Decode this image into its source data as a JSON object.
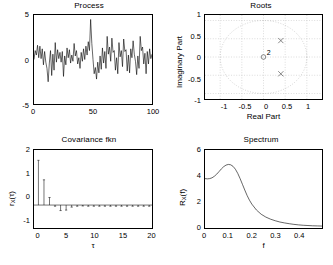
{
  "figure": {
    "background": "#ffffff",
    "line_color": "#000000",
    "grid_color": "#b8b8b8"
  },
  "panels": {
    "process": {
      "title": "Process",
      "xlabel": "",
      "ylabel": "",
      "xticks": [
        "0",
        "50",
        "100"
      ],
      "yticks": [
        "5",
        "0",
        "-5"
      ]
    },
    "roots": {
      "title": "Roots",
      "xlabel": "Real Part",
      "ylabel": "Imaginary Part",
      "xticks": [
        "-1",
        "-0.5",
        "0",
        "0.5",
        "1"
      ],
      "yticks": [
        "1",
        "0.5",
        "0",
        "-0.5",
        "-1"
      ],
      "zero_multiplicity": "2"
    },
    "covariance": {
      "title": "Covariance fkn",
      "xlabel": "τ",
      "ylabel_main": "r",
      "ylabel_sub": "X",
      "ylabel_arg": "(τ)",
      "xticks": [
        "0",
        "5",
        "10",
        "15",
        "20"
      ],
      "yticks": [
        "2",
        "1",
        "0",
        "-1"
      ]
    },
    "spectrum": {
      "title": "Spectrum",
      "xlabel": "f",
      "ylabel_main": "R",
      "ylabel_sub": "X",
      "ylabel_arg": "(f)",
      "xticks": [
        "0",
        "0.1",
        "0.2",
        "0.3",
        "0.4"
      ],
      "yticks": [
        "6",
        "4",
        "2",
        "0"
      ]
    }
  },
  "chart_data": [
    {
      "type": "line",
      "title": "Process",
      "xlabel": "",
      "ylabel": "",
      "xlim": [
        0,
        100
      ],
      "ylim": [
        -5,
        5
      ],
      "xticks": [
        0,
        50,
        100
      ],
      "yticks": [
        -5,
        0,
        5
      ],
      "grid": false,
      "x": [
        0,
        1,
        2,
        3,
        4,
        5,
        6,
        7,
        8,
        9,
        10,
        11,
        12,
        13,
        14,
        15,
        16,
        17,
        18,
        19,
        20,
        21,
        22,
        23,
        24,
        25,
        26,
        27,
        28,
        29,
        30,
        31,
        32,
        33,
        34,
        35,
        36,
        37,
        38,
        39,
        40,
        41,
        42,
        43,
        44,
        45,
        46,
        47,
        48,
        49,
        50,
        51,
        52,
        53,
        54,
        55,
        56,
        57,
        58,
        59,
        60,
        61,
        62,
        63,
        64,
        65,
        66,
        67,
        68,
        69,
        70,
        71,
        72,
        73,
        74,
        75,
        76,
        77,
        78,
        79,
        80,
        81,
        82,
        83,
        84,
        85,
        86,
        87,
        88,
        89,
        90,
        91,
        92,
        93,
        94,
        95,
        96,
        97,
        98,
        99,
        100
      ],
      "values": [
        0.0,
        1.0,
        0.5,
        1.6,
        0.2,
        1.5,
        0.1,
        1.2,
        -0.6,
        0.9,
        -0.3,
        -1.0,
        -2.5,
        -0.4,
        1.0,
        -1.8,
        0.6,
        -1.2,
        1.9,
        -0.3,
        1.1,
        0.1,
        0.8,
        -0.3,
        0.9,
        -1.9,
        0.4,
        -0.6,
        1.3,
        0.2,
        1.1,
        -0.4,
        0.5,
        -0.2,
        1.8,
        0.4,
        1.0,
        -0.5,
        0.2,
        -1.0,
        0.8,
        -0.2,
        1.2,
        0.0,
        1.5,
        0.5,
        2.0,
        1.0,
        4.5,
        1.8,
        0.0,
        -1.6,
        -0.9,
        -2.2,
        -0.3,
        -1.5,
        0.4,
        -1.1,
        1.3,
        -0.4,
        0.9,
        -1.0,
        2.6,
        0.6,
        1.4,
        -0.2,
        2.4,
        0.8,
        1.0,
        -1.2,
        0.2,
        -1.6,
        1.9,
        0.3,
        1.0,
        -0.8,
        2.3,
        0.9,
        1.1,
        -1.3,
        0.5,
        -1.5,
        1.2,
        0.2,
        2.1,
        0.6,
        -0.2,
        -1.7,
        0.4,
        -1.0,
        2.6,
        1.0,
        1.4,
        -0.5,
        0.7,
        -1.6,
        0.9,
        -0.5,
        1.2,
        0.1,
        0.6
      ]
    },
    {
      "type": "scatter",
      "title": "Roots",
      "xlabel": "Real Part",
      "ylabel": "Imaginary Part",
      "xlim": [
        -1.35,
        1.35
      ],
      "ylim": [
        -1.15,
        1.15
      ],
      "xticks": [
        -1,
        -0.5,
        0,
        0.5,
        1
      ],
      "yticks": [
        -1,
        -0.5,
        0,
        0.5,
        1
      ],
      "grid": true,
      "unit_circle": true,
      "series": [
        {
          "name": "poles",
          "marker": "x",
          "points": [
            [
              0.4,
              0.45
            ],
            [
              0.4,
              -0.46
            ]
          ]
        },
        {
          "name": "zeros",
          "marker": "o",
          "points": [
            [
              0.0,
              0.0
            ]
          ],
          "label": "2"
        }
      ]
    },
    {
      "type": "bar",
      "title": "Covariance fkn",
      "xlabel": "τ",
      "ylabel": "r_X(τ)",
      "xlim": [
        -0.8,
        20.5
      ],
      "ylim": [
        -1,
        2.4
      ],
      "xticks": [
        0,
        5,
        10,
        15,
        20
      ],
      "yticks": [
        -1,
        0,
        1,
        2
      ],
      "grid": false,
      "categories": [
        0,
        1,
        2,
        3,
        4,
        5,
        6,
        7,
        8,
        9,
        10,
        11,
        12,
        13,
        14,
        15,
        16,
        17,
        18,
        19,
        20
      ],
      "values": [
        1.95,
        1.1,
        0.33,
        -0.05,
        -0.24,
        -0.22,
        -0.09,
        -0.05,
        -0.04,
        -0.05,
        -0.05,
        -0.05,
        -0.05,
        -0.05,
        -0.05,
        -0.05,
        -0.05,
        -0.05,
        -0.05,
        -0.05,
        -0.05
      ]
    },
    {
      "type": "line",
      "title": "Spectrum",
      "xlabel": "f",
      "ylabel": "R_X(f)",
      "xlim": [
        0,
        0.5
      ],
      "ylim": [
        0,
        6
      ],
      "xticks": [
        0,
        0.1,
        0.2,
        0.3,
        0.4
      ],
      "yticks": [
        0,
        2,
        4,
        6
      ],
      "grid": false,
      "x": [
        0.0,
        0.01,
        0.02,
        0.03,
        0.04,
        0.05,
        0.06,
        0.07,
        0.08,
        0.09,
        0.1,
        0.11,
        0.12,
        0.13,
        0.14,
        0.15,
        0.16,
        0.17,
        0.18,
        0.19,
        0.2,
        0.22,
        0.24,
        0.26,
        0.28,
        0.3,
        0.32,
        0.34,
        0.36,
        0.38,
        0.4,
        0.42,
        0.44,
        0.46,
        0.48,
        0.5
      ],
      "values": [
        3.8,
        3.78,
        3.8,
        3.86,
        3.98,
        4.14,
        4.34,
        4.55,
        4.72,
        4.84,
        4.89,
        4.86,
        4.74,
        4.52,
        4.2,
        3.8,
        3.36,
        2.92,
        2.5,
        2.14,
        1.84,
        1.38,
        1.06,
        0.84,
        0.68,
        0.56,
        0.46,
        0.39,
        0.33,
        0.28,
        0.24,
        0.21,
        0.19,
        0.17,
        0.16,
        0.15
      ]
    }
  ]
}
